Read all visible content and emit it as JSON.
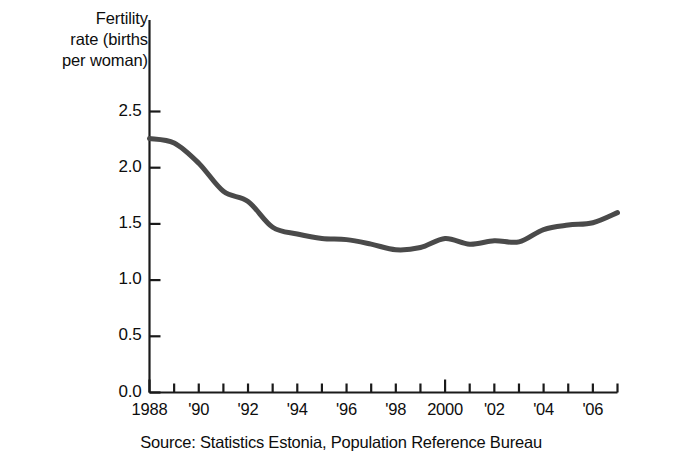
{
  "chart_data": {
    "type": "line",
    "title": "",
    "subtitle": "",
    "ylabel_lines": [
      "Fertility",
      "rate (births",
      "per woman)"
    ],
    "ylabel": "Fertility rate (births per woman)",
    "xlabel": "",
    "source": "Source:  Statistics Estonia, Population Reference Bureau",
    "ylim": [
      0.0,
      2.5
    ],
    "yticks": [
      0.0,
      0.5,
      1.0,
      1.5,
      2.0,
      2.5
    ],
    "ytick_labels": [
      "0.0",
      "0.5",
      "1.0",
      "1.5",
      "2.0",
      "2.5"
    ],
    "xlim": [
      1988,
      2007
    ],
    "xticks": [
      1988,
      1989,
      1990,
      1991,
      1992,
      1993,
      1994,
      1995,
      1996,
      1997,
      1998,
      1999,
      2000,
      2001,
      2002,
      2003,
      2004,
      2005,
      2006,
      2007
    ],
    "xtick_labels_shown": [
      {
        "year": 1988,
        "label": "1988"
      },
      {
        "year": 1990,
        "label": "'90"
      },
      {
        "year": 1992,
        "label": "'92"
      },
      {
        "year": 1994,
        "label": "'94"
      },
      {
        "year": 1996,
        "label": "'96"
      },
      {
        "year": 1998,
        "label": "'98"
      },
      {
        "year": 2000,
        "label": "2000"
      },
      {
        "year": 2002,
        "label": "'02"
      },
      {
        "year": 2004,
        "label": "'04"
      },
      {
        "year": 2006,
        "label": "'06"
      }
    ],
    "grid": false,
    "legend": false,
    "legend_position": "none",
    "line_color": "#4a4a4a",
    "line_width": 5,
    "axis_color": "#1a1a1a",
    "x": [
      1988,
      1989,
      1990,
      1991,
      1992,
      1993,
      1994,
      1995,
      1996,
      1997,
      1998,
      1999,
      2000,
      2001,
      2002,
      2003,
      2004,
      2005,
      2006,
      2007
    ],
    "values": [
      2.26,
      2.22,
      2.04,
      1.79,
      1.7,
      1.47,
      1.41,
      1.37,
      1.36,
      1.32,
      1.27,
      1.29,
      1.37,
      1.32,
      1.35,
      1.34,
      1.45,
      1.49,
      1.51,
      1.6
    ],
    "series": [
      {
        "name": "Fertility rate (births per woman)",
        "values": [
          2.26,
          2.22,
          2.04,
          1.79,
          1.7,
          1.47,
          1.41,
          1.37,
          1.36,
          1.32,
          1.27,
          1.29,
          1.37,
          1.32,
          1.35,
          1.34,
          1.45,
          1.49,
          1.51,
          1.6
        ]
      }
    ]
  }
}
